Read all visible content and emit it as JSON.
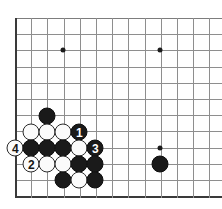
{
  "diagram": {
    "kind": "go-board-corner-diagram",
    "board": {
      "origin_x": 15,
      "origin_y": 18,
      "cell": 16.2,
      "cols": 13,
      "rows": 12,
      "line_color": "#8e8e8e",
      "border_color": "#3a3a3a",
      "background_color": "#ffffff"
    },
    "star_points": [
      {
        "name": "star-point-upper",
        "x": 63,
        "y": 50
      },
      {
        "name": "star-point-upper-right",
        "x": 160,
        "y": 50
      },
      {
        "name": "star-point-lower-right",
        "x": 160,
        "y": 148
      }
    ],
    "stones": [
      {
        "name": "stone-black-a",
        "color": "black",
        "x": 47,
        "y": 116,
        "label": ""
      },
      {
        "name": "stone-white-a",
        "color": "white",
        "x": 31,
        "y": 132,
        "label": ""
      },
      {
        "name": "stone-white-b",
        "color": "white",
        "x": 47,
        "y": 132,
        "label": ""
      },
      {
        "name": "stone-white-c",
        "color": "white",
        "x": 63,
        "y": 132,
        "label": ""
      },
      {
        "name": "stone-black-move-1",
        "color": "black",
        "x": 79,
        "y": 132,
        "label": "1"
      },
      {
        "name": "stone-white-move-4",
        "color": "white",
        "x": 15,
        "y": 148,
        "label": "4"
      },
      {
        "name": "stone-black-b",
        "color": "black",
        "x": 31,
        "y": 148,
        "label": ""
      },
      {
        "name": "stone-black-c",
        "color": "black",
        "x": 47,
        "y": 148,
        "label": ""
      },
      {
        "name": "stone-black-d",
        "color": "black",
        "x": 63,
        "y": 148,
        "label": ""
      },
      {
        "name": "stone-white-d",
        "color": "white",
        "x": 79,
        "y": 148,
        "label": ""
      },
      {
        "name": "stone-black-move-3",
        "color": "black",
        "x": 95,
        "y": 148,
        "label": "3"
      },
      {
        "name": "stone-white-move-2",
        "color": "white",
        "x": 31,
        "y": 164,
        "label": "2"
      },
      {
        "name": "stone-white-e",
        "color": "white",
        "x": 47,
        "y": 164,
        "label": ""
      },
      {
        "name": "stone-white-f",
        "color": "white",
        "x": 63,
        "y": 164,
        "label": ""
      },
      {
        "name": "stone-black-e",
        "color": "black",
        "x": 79,
        "y": 164,
        "label": ""
      },
      {
        "name": "stone-black-f",
        "color": "black",
        "x": 95,
        "y": 164,
        "label": ""
      },
      {
        "name": "stone-black-g",
        "color": "black",
        "x": 160,
        "y": 164,
        "label": ""
      },
      {
        "name": "stone-black-h",
        "color": "black",
        "x": 63,
        "y": 180,
        "label": ""
      },
      {
        "name": "stone-white-g",
        "color": "white",
        "x": 79,
        "y": 180,
        "label": ""
      },
      {
        "name": "stone-black-i",
        "color": "black",
        "x": 95,
        "y": 180,
        "label": ""
      }
    ],
    "move_numbers": [
      "1",
      "2",
      "3",
      "4"
    ],
    "colors": {
      "black_stone": "#1a1a1a",
      "white_stone": "#fbfbfb",
      "stone_outline": "#2a2a2a",
      "black_label": "#ffffff",
      "white_label": "#161616"
    }
  }
}
